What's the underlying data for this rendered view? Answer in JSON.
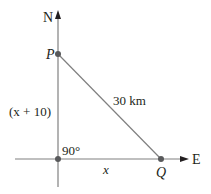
{
  "diagram": {
    "axes": {
      "north_label": "N",
      "east_label": "E"
    },
    "points": {
      "P": {
        "label": "P",
        "x": 58,
        "y": 54
      },
      "Q": {
        "label": "Q",
        "x": 161,
        "y": 159
      },
      "O": {
        "x": 58,
        "y": 159
      }
    },
    "labels": {
      "vertical_side": "(x + 10)",
      "hypotenuse": "30 km",
      "angle": "90°",
      "horizontal_side": "x"
    },
    "colors": {
      "line": "#808080",
      "point": "#58595b",
      "text": "#231f20"
    }
  }
}
